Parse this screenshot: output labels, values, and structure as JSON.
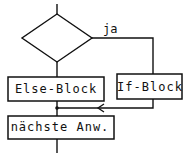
{
  "diagram": {
    "type": "flowchart",
    "decision": {
      "shape": "diamond",
      "true_label": "ja"
    },
    "blocks": {
      "else_block": "Else-Block",
      "if_block": "If-Block",
      "next_statement": "nächste Anw."
    },
    "colors": {
      "line": "#111111",
      "background": "#ffffff"
    }
  }
}
